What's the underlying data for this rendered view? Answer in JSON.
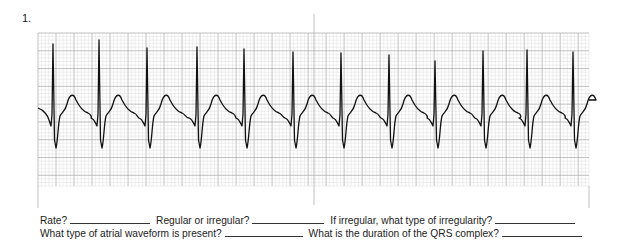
{
  "exercise": {
    "number": "1."
  },
  "strip": {
    "grid": {
      "left": 38,
      "top": 33,
      "right": 589,
      "bottom": 186,
      "small_box": 3.6,
      "large_box": 18,
      "minor_color": "#d6d6d6",
      "major_color": "#a8a8a8",
      "border_color": "#c0c0c0"
    },
    "trace_color": "#111111",
    "baseline_y": 110,
    "r_peaks_x": [
      53,
      99,
      147,
      197,
      244,
      293,
      341,
      389,
      435,
      483,
      527,
      573
    ],
    "r_peaks_y": [
      44,
      40,
      48,
      47,
      49,
      52,
      53,
      55,
      61,
      51,
      50,
      52
    ],
    "divider_ticks": [
      {
        "x": 314,
        "top": 14,
        "bottom": 205
      },
      {
        "x": 38,
        "top": 186,
        "bottom": 208
      },
      {
        "x": 589,
        "top": 186,
        "bottom": 208
      }
    ]
  },
  "questions": {
    "line1": [
      {
        "label": "Rate?",
        "blank_width": 80
      },
      {
        "label": "Regular or irregular?",
        "blank_width": 72
      },
      {
        "label": "If irregular, what type of irregularity?",
        "blank_width": 80
      }
    ],
    "line2": [
      {
        "label": "What type of atrial waveform is present?",
        "blank_width": 78
      },
      {
        "label": "What is the duration of the QRS complex?",
        "blank_width": 80
      }
    ]
  }
}
